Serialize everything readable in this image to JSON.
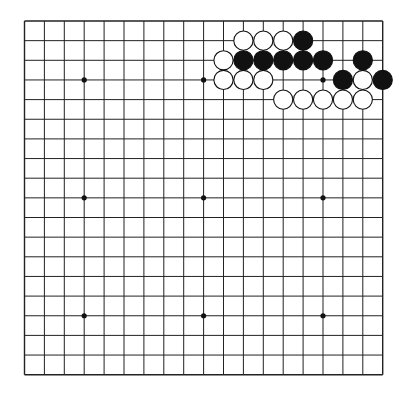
{
  "board": {
    "size": 19,
    "origin": {
      "x": 24.5,
      "y": 21
    },
    "spacing": {
      "x": 19.9,
      "y": 19.65
    },
    "line_color": "#222222",
    "background": "#ffffff",
    "star_points": [
      [
        3,
        3
      ],
      [
        9,
        3
      ],
      [
        15,
        3
      ],
      [
        3,
        9
      ],
      [
        9,
        9
      ],
      [
        15,
        9
      ],
      [
        3,
        15
      ],
      [
        9,
        15
      ],
      [
        15,
        15
      ]
    ],
    "stones": [
      {
        "col": 11,
        "row": 1,
        "color": "white"
      },
      {
        "col": 12,
        "row": 1,
        "color": "white"
      },
      {
        "col": 13,
        "row": 1,
        "color": "white"
      },
      {
        "col": 14,
        "row": 1,
        "color": "black"
      },
      {
        "col": 10,
        "row": 2,
        "color": "white"
      },
      {
        "col": 11,
        "row": 2,
        "color": "black"
      },
      {
        "col": 12,
        "row": 2,
        "color": "black"
      },
      {
        "col": 13,
        "row": 2,
        "color": "black"
      },
      {
        "col": 14,
        "row": 2,
        "color": "black"
      },
      {
        "col": 15,
        "row": 2,
        "color": "black"
      },
      {
        "col": 17,
        "row": 2,
        "color": "black"
      },
      {
        "col": 10,
        "row": 3,
        "color": "white"
      },
      {
        "col": 11,
        "row": 3,
        "color": "white"
      },
      {
        "col": 12,
        "row": 3,
        "color": "white"
      },
      {
        "col": 16,
        "row": 3,
        "color": "black"
      },
      {
        "col": 17,
        "row": 3,
        "color": "white"
      },
      {
        "col": 18,
        "row": 3,
        "color": "black"
      },
      {
        "col": 13,
        "row": 4,
        "color": "white"
      },
      {
        "col": 14,
        "row": 4,
        "color": "white"
      },
      {
        "col": 15,
        "row": 4,
        "color": "white"
      },
      {
        "col": 16,
        "row": 4,
        "color": "white"
      },
      {
        "col": 17,
        "row": 4,
        "color": "white"
      }
    ]
  }
}
